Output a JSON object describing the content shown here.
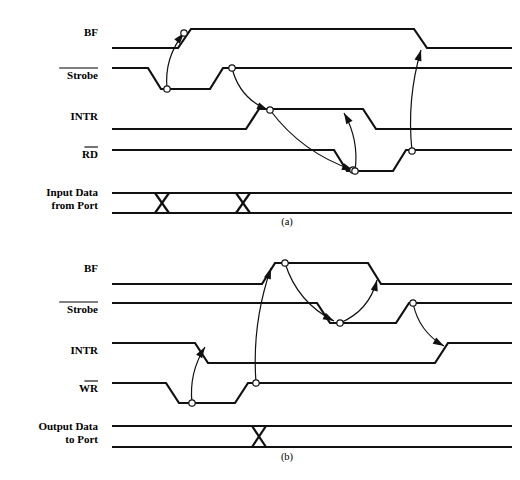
{
  "figure": {
    "kind": "timing-diagram",
    "background": "#ffffff",
    "ink_color": "#111111",
    "width": 520,
    "height": 480
  },
  "diagrams": [
    {
      "id": "a",
      "caption": "(a)",
      "caption_pos": {
        "x": 287,
        "y": 225
      },
      "signals": [
        {
          "name": "BF",
          "label": "BF",
          "overline": false,
          "label_pos": {
            "x": 98,
            "y": 36
          },
          "kind": "logic",
          "high_y": 29,
          "low_y": 48,
          "start_level": "low",
          "edges": [
            {
              "x": 178,
              "to": "high"
            },
            {
              "x": 414,
              "to": "low"
            }
          ]
        },
        {
          "name": "Strobe",
          "label": "Strobe",
          "overline": true,
          "label_pos": {
            "x": 98,
            "y": 79
          },
          "kind": "logic",
          "high_y": 68,
          "low_y": 89,
          "start_level": "high",
          "edges": [
            {
              "x": 148,
              "to": "low"
            },
            {
              "x": 210,
              "to": "high"
            }
          ]
        },
        {
          "name": "INTR",
          "label": "INTR",
          "overline": false,
          "label_pos": {
            "x": 98,
            "y": 120
          },
          "kind": "logic",
          "high_y": 109,
          "low_y": 129,
          "start_level": "low",
          "edges": [
            {
              "x": 246,
              "to": "high"
            },
            {
              "x": 363,
              "to": "low"
            }
          ]
        },
        {
          "name": "RD",
          "label": "RD",
          "overline": true,
          "label_pos": {
            "x": 98,
            "y": 158
          },
          "kind": "logic",
          "high_y": 150,
          "low_y": 171,
          "start_level": "high",
          "edges": [
            {
              "x": 334,
              "to": "low"
            },
            {
              "x": 393,
              "to": "high"
            }
          ]
        },
        {
          "name": "InputData",
          "label": "Input Data",
          "label2": "from Port",
          "overline": false,
          "label_pos": {
            "x": 98,
            "y": 196
          },
          "label2_pos": {
            "x": 98,
            "y": 209
          },
          "kind": "bus",
          "top_y": 193,
          "bottom_y": 213,
          "crossings": [
            162,
            243
          ]
        }
      ],
      "causal_arrows": [
        {
          "from": {
            "x": 167,
            "y": 89
          },
          "to": {
            "x": 184,
            "y": 33
          },
          "bow": -12,
          "head": "up",
          "knob_at": "both"
        },
        {
          "from": {
            "x": 232,
            "y": 68
          },
          "to": {
            "x": 268,
            "y": 110
          },
          "bow": 14,
          "head": "down-right",
          "knob_at": "from"
        },
        {
          "from": {
            "x": 270,
            "y": 110
          },
          "to": {
            "x": 353,
            "y": 170
          },
          "bow": 16,
          "head": "down-right",
          "knob_at": "both"
        },
        {
          "from": {
            "x": 355,
            "y": 171
          },
          "to": {
            "x": 344,
            "y": 113
          },
          "bow": 10,
          "head": "up",
          "knob_at": "from"
        },
        {
          "from": {
            "x": 412,
            "y": 151
          },
          "to": {
            "x": 421,
            "y": 50
          },
          "bow": -10,
          "head": "up",
          "knob_at": "from"
        }
      ]
    },
    {
      "id": "b",
      "caption": "(b)",
      "caption_pos": {
        "x": 287,
        "y": 460
      },
      "signals": [
        {
          "name": "BF",
          "label": "BF",
          "overline": false,
          "label_pos": {
            "x": 98,
            "y": 272
          },
          "kind": "logic",
          "high_y": 263,
          "low_y": 284,
          "start_level": "low",
          "edges": [
            {
              "x": 262,
              "to": "high"
            },
            {
              "x": 368,
              "to": "low"
            }
          ]
        },
        {
          "name": "Strobe",
          "label": "Strobe",
          "overline": true,
          "label_pos": {
            "x": 98,
            "y": 313
          },
          "kind": "logic",
          "high_y": 303,
          "low_y": 323,
          "start_level": "high",
          "edges": [
            {
              "x": 317,
              "to": "low"
            },
            {
              "x": 396,
              "to": "high"
            }
          ]
        },
        {
          "name": "INTR",
          "label": "INTR",
          "overline": false,
          "label_pos": {
            "x": 98,
            "y": 354
          },
          "kind": "logic",
          "high_y": 343,
          "low_y": 363,
          "start_level": "high",
          "edges": [
            {
              "x": 195,
              "to": "low"
            },
            {
              "x": 435,
              "to": "high"
            }
          ]
        },
        {
          "name": "WR",
          "label": "WR",
          "overline": true,
          "label_pos": {
            "x": 98,
            "y": 392
          },
          "kind": "logic",
          "high_y": 383,
          "low_y": 403,
          "start_level": "high",
          "edges": [
            {
              "x": 166,
              "to": "low"
            },
            {
              "x": 235,
              "to": "high"
            }
          ]
        },
        {
          "name": "OutputData",
          "label": "Output Data",
          "label2": "to Port",
          "overline": false,
          "label_pos": {
            "x": 98,
            "y": 430
          },
          "label2_pos": {
            "x": 98,
            "y": 443
          },
          "kind": "bus",
          "top_y": 426,
          "bottom_y": 447,
          "crossings": [
            259
          ]
        }
      ],
      "causal_arrows": [
        {
          "from": {
            "x": 192,
            "y": 403
          },
          "to": {
            "x": 205,
            "y": 347
          },
          "bow": -10,
          "head": "up",
          "knob_at": "from"
        },
        {
          "from": {
            "x": 256,
            "y": 383
          },
          "to": {
            "x": 271,
            "y": 268
          },
          "bow": -12,
          "head": "up",
          "knob_at": "from"
        },
        {
          "from": {
            "x": 285,
            "y": 263
          },
          "to": {
            "x": 334,
            "y": 321
          },
          "bow": 16,
          "head": "down-right",
          "knob_at": "from"
        },
        {
          "from": {
            "x": 340,
            "y": 323
          },
          "to": {
            "x": 377,
            "y": 280
          },
          "bow": 14,
          "head": "up",
          "knob_at": "from"
        },
        {
          "from": {
            "x": 413,
            "y": 303
          },
          "to": {
            "x": 444,
            "y": 346
          },
          "bow": 12,
          "head": "down-right",
          "knob_at": "from"
        }
      ]
    }
  ]
}
